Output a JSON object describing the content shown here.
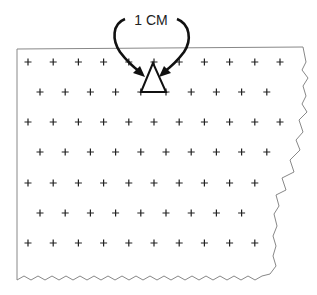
{
  "figure": {
    "label": "1 CM",
    "colors": {
      "stroke": "#222222",
      "edge": "#888888",
      "background": "#ffffff"
    },
    "grid": {
      "symbol": "+",
      "rows": [
        {
          "y": 62,
          "x0": 28,
          "count": 11
        },
        {
          "y": 92,
          "x0": 40,
          "count": 10
        },
        {
          "y": 122,
          "x0": 28,
          "count": 11
        },
        {
          "y": 152,
          "x0": 40,
          "count": 10
        },
        {
          "y": 183,
          "x0": 28,
          "count": 10
        },
        {
          "y": 213,
          "x0": 40,
          "count": 9
        },
        {
          "y": 243,
          "x0": 28,
          "count": 10
        }
      ],
      "spacing": 25.2
    },
    "triangle": {
      "apex": [
        153,
        62
      ],
      "left": [
        141,
        92
      ],
      "right": [
        166,
        92
      ]
    }
  }
}
